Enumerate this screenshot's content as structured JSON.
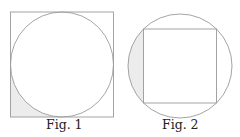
{
  "figures": [
    {
      "caption": "Fig. 1",
      "description": "circle inscribed in square, bottom-left corner region shaded"
    },
    {
      "caption": "Fig. 2",
      "description": "square inscribed in circle, left circular segment shaded"
    }
  ],
  "colors": {
    "stroke": "#9a9a9a",
    "shade": "#ececec"
  }
}
